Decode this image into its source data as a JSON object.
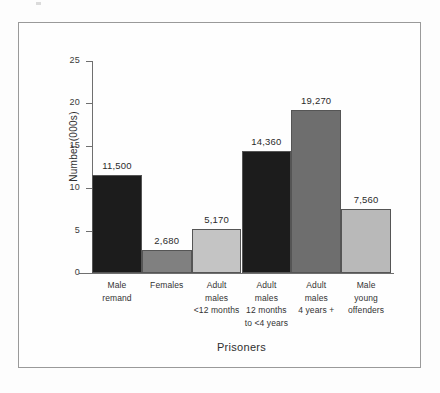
{
  "figure": {
    "frame_border_color": "#9a9a9a",
    "background": "#fefefe"
  },
  "chart_data": {
    "type": "bar",
    "title": "",
    "xlabel": "Prisoners",
    "ylabel": "Number (000s)",
    "ylim": [
      0,
      25
    ],
    "ytick_step": 5,
    "yticks": [
      "0",
      "5",
      "10",
      "15",
      "20",
      "25"
    ],
    "grid": false,
    "legend": "none",
    "categories": [
      "Male remand",
      "Females",
      "Adult males <12 months",
      "Adult males 12 months to <4 years",
      "Adult males 4 years +",
      "Male young offenders"
    ],
    "category_label_lines": [
      [
        "Male",
        "remand"
      ],
      [
        "Females"
      ],
      [
        "Adult",
        "males",
        "<12 months"
      ],
      [
        "Adult",
        "males",
        "12 months",
        "to <4 years"
      ],
      [
        "Adult",
        "males",
        "4 years +"
      ],
      [
        "Male",
        "young",
        "offenders"
      ]
    ],
    "values": [
      11.5,
      2.68,
      5.17,
      14.36,
      19.27,
      7.56
    ],
    "value_labels": [
      "11,500",
      "2,680",
      "5,170",
      "14,360",
      "19,270",
      "7,560"
    ],
    "bar_colors": [
      "#1c1c1c",
      "#808080",
      "#c4c4c4",
      "#1c1c1c",
      "#6e6e6e",
      "#b9b9b9"
    ],
    "bars": [
      {
        "label": "Male remand",
        "value": 11.5,
        "value_label": "11,500",
        "color": "#1c1c1c"
      },
      {
        "label": "Females",
        "value": 2.68,
        "value_label": "2,680",
        "color": "#808080"
      },
      {
        "label": "Adult males <12 months",
        "value": 5.17,
        "value_label": "5,170",
        "color": "#c4c4c4"
      },
      {
        "label": "Adult males 12 months to <4 years",
        "value": 14.36,
        "value_label": "14,360",
        "color": "#1c1c1c"
      },
      {
        "label": "Adult males 4 years +",
        "value": 19.27,
        "value_label": "19,270",
        "color": "#6e6e6e"
      },
      {
        "label": "Male young offenders",
        "value": 7.56,
        "value_label": "7,560",
        "color": "#b9b9b9"
      }
    ]
  }
}
